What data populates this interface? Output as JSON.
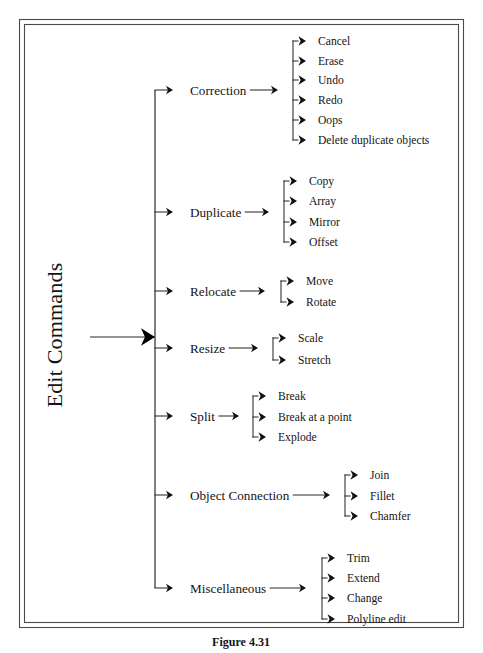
{
  "figure": {
    "caption": "Figure 4.31",
    "root_label": "Edit Commands",
    "frame": {
      "outer": {
        "x": 19,
        "y": 19,
        "width": 445,
        "height": 609
      },
      "inner": {
        "x": 24,
        "y": 24,
        "width": 435,
        "height": 599
      }
    },
    "colors": {
      "line": "#2b2b2b",
      "frame": "#4a4a4a",
      "text": "#141414",
      "background": "#ffffff",
      "arrowhead": "#111111"
    },
    "root": {
      "label": "Edit Commands",
      "rotation_deg": -90,
      "text_x": 62,
      "text_y": 335,
      "stem_from_x": 90,
      "stem_to_x": 155,
      "stem_y": 337
    },
    "trunk": {
      "x": 155,
      "y_top": 90,
      "y_bottom": 588
    }
  },
  "chart_data": {
    "type": "tree",
    "title": "Edit Commands",
    "orientation": "left-to-right",
    "root": "Edit Commands",
    "node_count": 31,
    "categories": [
      {
        "label": "Correction",
        "y": 90,
        "label_x": 190,
        "arrow_x": 170,
        "stem_to_x": 275,
        "connector_x": 293,
        "leaf_x": 318,
        "leaf_arrow_x": 298,
        "children": [
          {
            "label": "Cancel",
            "y": 41
          },
          {
            "label": "Erase",
            "y": 61
          },
          {
            "label": "Undo",
            "y": 80
          },
          {
            "label": "Redo",
            "y": 100
          },
          {
            "label": "Oops",
            "y": 120
          },
          {
            "label": "Delete duplicate objects",
            "y": 140
          }
        ]
      },
      {
        "label": "Duplicate",
        "y": 212,
        "label_x": 190,
        "arrow_x": 170,
        "stem_to_x": 266,
        "connector_x": 284,
        "leaf_x": 309,
        "leaf_arrow_x": 289,
        "children": [
          {
            "label": "Copy",
            "y": 181
          },
          {
            "label": "Array",
            "y": 201
          },
          {
            "label": "Mirror",
            "y": 222
          },
          {
            "label": "Offset",
            "y": 242
          }
        ]
      },
      {
        "label": "Relocate",
        "y": 291,
        "label_x": 190,
        "arrow_x": 170,
        "stem_to_x": 262,
        "connector_x": 281,
        "leaf_x": 306,
        "leaf_arrow_x": 286,
        "children": [
          {
            "label": "Move",
            "y": 281
          },
          {
            "label": "Rotate",
            "y": 302
          }
        ]
      },
      {
        "label": "Resize",
        "y": 348,
        "label_x": 190,
        "arrow_x": 170,
        "stem_to_x": 255,
        "connector_x": 273,
        "leaf_x": 298,
        "leaf_arrow_x": 278,
        "children": [
          {
            "label": "Scale",
            "y": 338
          },
          {
            "label": "Stretch",
            "y": 360
          }
        ]
      },
      {
        "label": "Split",
        "y": 416,
        "label_x": 190,
        "arrow_x": 170,
        "stem_to_x": 236,
        "connector_x": 253,
        "leaf_x": 278,
        "leaf_arrow_x": 258,
        "children": [
          {
            "label": "Break",
            "y": 396
          },
          {
            "label": "Break at a point",
            "y": 417
          },
          {
            "label": "Explode",
            "y": 437
          }
        ]
      },
      {
        "label": "Object Connection",
        "y": 495,
        "label_x": 190,
        "arrow_x": 170,
        "stem_to_x": 327,
        "connector_x": 345,
        "leaf_x": 370,
        "leaf_arrow_x": 350,
        "children": [
          {
            "label": "Join",
            "y": 475
          },
          {
            "label": "Fillet",
            "y": 496
          },
          {
            "label": "Chamfer",
            "y": 516
          }
        ]
      },
      {
        "label": "Miscellaneous",
        "y": 588,
        "label_x": 190,
        "arrow_x": 170,
        "stem_to_x": 303,
        "connector_x": 322,
        "leaf_x": 347,
        "leaf_arrow_x": 327,
        "children": [
          {
            "label": "Trim",
            "y": 558
          },
          {
            "label": "Extend",
            "y": 578
          },
          {
            "label": "Change",
            "y": 598
          },
          {
            "label": "Polyline edit",
            "y": 619
          }
        ]
      }
    ]
  }
}
